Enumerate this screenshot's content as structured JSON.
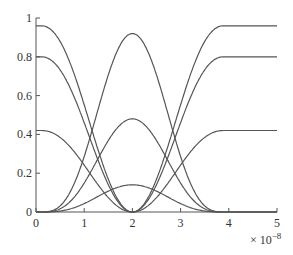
{
  "chart_data": {
    "type": "line",
    "title": "",
    "xlabel": "",
    "ylabel": "",
    "x_multiplier": "× 10^-8",
    "xlim": [
      0,
      5
    ],
    "ylim": [
      0,
      1
    ],
    "xticks": [
      "0",
      "1",
      "2",
      "3",
      "4",
      "5"
    ],
    "yticks": [
      "0",
      "0.2",
      "0.4",
      "0.6",
      "0.8",
      "1"
    ],
    "grid": false,
    "legend": null,
    "series": [
      {
        "name": "dip-0.96",
        "start": 0.96,
        "end": 0.96,
        "min_at": 2,
        "min": 0
      },
      {
        "name": "dip-0.8",
        "start": 0.8,
        "end": 0.8,
        "min_at": 2,
        "min": 0
      },
      {
        "name": "dip-0.42",
        "start": 0.42,
        "end": 0.42,
        "min_at": 2,
        "min": 0
      },
      {
        "name": "bump-0.92",
        "start": 0,
        "end": 0,
        "peak_at": 2,
        "peak": 0.92
      },
      {
        "name": "bump-0.48",
        "start": 0,
        "end": 0,
        "peak_at": 2,
        "peak": 0.48
      },
      {
        "name": "bump-0.14",
        "start": 0,
        "end": 0,
        "peak_at": 2,
        "peak": 0.14
      }
    ]
  },
  "axis": {
    "exp_base": "× 10",
    "exp_power": "−8"
  }
}
